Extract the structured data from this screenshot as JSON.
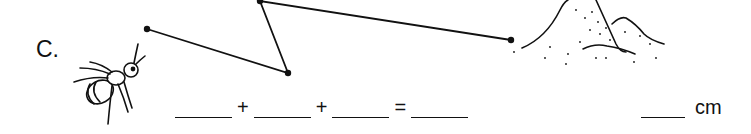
{
  "problem": {
    "label": "C.",
    "path_points": [
      [
        147,
        29
      ],
      [
        288,
        73
      ],
      [
        260,
        1
      ],
      [
        511,
        40
      ]
    ],
    "start_figure": "ant-icon",
    "end_figure": "anthill-icon"
  },
  "equation": {
    "op1": "+",
    "op2": "+",
    "eq": "=",
    "blank_count": 4
  },
  "answer": {
    "unit": "cm"
  }
}
